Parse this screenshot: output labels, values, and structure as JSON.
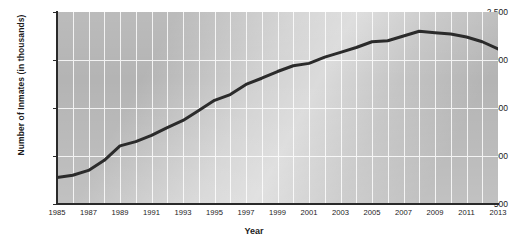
{
  "chart_data": {
    "type": "line",
    "title": "",
    "xlabel": "Year",
    "ylabel": "Number of Inmates (in thousands)",
    "xlim": [
      1985,
      2013
    ],
    "ylim": [
      500,
      2500
    ],
    "ytick_labels": [
      "2,500",
      "2,000",
      "1,500",
      "1,000",
      "500"
    ],
    "ytick_values": [
      2500,
      2000,
      1500,
      1000,
      500
    ],
    "xtick_labels": [
      "1985",
      "1987",
      "1989",
      "1991",
      "1993",
      "1995",
      "1997",
      "1999",
      "2001",
      "2003",
      "2005",
      "2007",
      "2009",
      "2011",
      "2013"
    ],
    "xtick_values": [
      1985,
      1987,
      1989,
      1991,
      1993,
      1995,
      1997,
      1999,
      2001,
      2003,
      2005,
      2007,
      2009,
      2011,
      2013
    ],
    "grid": true,
    "grid_color": "#f2f2f2",
    "plot_background": "#b4b4b4",
    "line_color": "#2b2b2b",
    "line_width": 3,
    "legend": "none",
    "x": [
      1985,
      1986,
      1987,
      1988,
      1989,
      1990,
      1991,
      1992,
      1993,
      1994,
      1995,
      1996,
      1997,
      1998,
      1999,
      2000,
      2001,
      2002,
      2003,
      2004,
      2005,
      2006,
      2007,
      2008,
      2009,
      2010,
      2011,
      2012,
      2013
    ],
    "values": [
      775,
      800,
      850,
      955,
      1105,
      1150,
      1215,
      1295,
      1370,
      1475,
      1580,
      1640,
      1745,
      1810,
      1880,
      1940,
      1965,
      2030,
      2080,
      2130,
      2190,
      2200,
      2250,
      2300,
      2285,
      2270,
      2240,
      2190,
      2115
    ],
    "series": [
      {
        "name": "Number of Inmates",
        "values": [
          775,
          800,
          850,
          955,
          1105,
          1150,
          1215,
          1295,
          1370,
          1475,
          1580,
          1640,
          1745,
          1810,
          1880,
          1940,
          1965,
          2030,
          2080,
          2130,
          2190,
          2200,
          2250,
          2300,
          2285,
          2270,
          2240,
          2190,
          2115
        ]
      }
    ]
  }
}
